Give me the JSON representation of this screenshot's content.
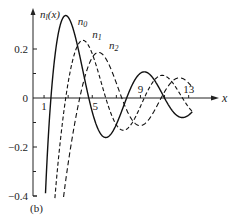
{
  "chart_data": {
    "type": "line",
    "title": "",
    "panel_label": "(b)",
    "xlabel": "x",
    "ylabel": "n_l(x)",
    "xlim": [
      0,
      15
    ],
    "ylim": [
      -0.4,
      0.35
    ],
    "grid": false,
    "x_ticks": [
      1,
      5,
      9,
      13
    ],
    "x_minor_ticks": [
      3,
      7,
      11
    ],
    "y_ticks": [
      {
        "value": 0.2,
        "label": "0.2"
      },
      {
        "value": 0,
        "label": "0"
      },
      {
        "value": -0.2,
        "label": "−0.2"
      },
      {
        "value": -0.4,
        "label": "−0.4"
      }
    ],
    "y_minor_ticks": [
      0.1,
      -0.1,
      -0.3
    ],
    "series": [
      {
        "name": "n_0",
        "label": "n",
        "sub": "0",
        "style": "solid",
        "formula": "-cos(x)/x",
        "label_pos": [
          3.8,
          0.3
        ]
      },
      {
        "name": "n_1",
        "label": "n",
        "sub": "1",
        "style": "dashed",
        "formula": "-cos(x)/x^2 - sin(x)/x",
        "label_pos": [
          5.0,
          0.245
        ]
      },
      {
        "name": "n_2",
        "label": "n",
        "sub": "2",
        "style": "dashed",
        "formula": "(-3/x^3 + 1/x)cos(x) - 3 sin(x)/x^2",
        "label_pos": [
          6.4,
          0.2
        ]
      }
    ],
    "sample_points": {
      "n_0": [
        [
          1.5,
          -0.047
        ],
        [
          2,
          0.208
        ],
        [
          3,
          0.33
        ],
        [
          4,
          0.163
        ],
        [
          5,
          -0.057
        ],
        [
          6,
          -0.16
        ],
        [
          7,
          -0.108
        ],
        [
          8,
          0.018
        ],
        [
          9,
          0.101
        ],
        [
          10,
          0.084
        ],
        [
          12,
          -0.07
        ],
        [
          13,
          -0.068
        ]
      ],
      "n_1": [
        [
          2,
          -0.351
        ],
        [
          3,
          0.063
        ],
        [
          4,
          0.23
        ],
        [
          5,
          0.181
        ],
        [
          6,
          0.007
        ],
        [
          7,
          -0.114
        ],
        [
          8,
          -0.121
        ],
        [
          9,
          -0.034
        ],
        [
          10,
          0.063
        ],
        [
          11,
          0.097
        ],
        [
          12,
          0.044
        ],
        [
          13,
          -0.046
        ]
      ],
      "n_2": [
        [
          3,
          -0.358
        ],
        [
          4,
          0.015
        ],
        [
          5,
          0.164
        ],
        [
          6,
          0.186
        ],
        [
          7,
          0.074
        ],
        [
          8,
          -0.054
        ],
        [
          9,
          -0.106
        ],
        [
          10,
          -0.063
        ],
        [
          11,
          0.022
        ],
        [
          12,
          0.08
        ],
        [
          13,
          0.064
        ]
      ]
    }
  }
}
